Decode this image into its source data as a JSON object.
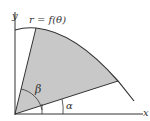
{
  "diagram": {
    "curve_label": "r = f(θ)",
    "axis_x_label": "x",
    "axis_y_label": "y",
    "angle_upper_label": "β",
    "angle_lower_label": "α",
    "colors": {
      "region_fill": "#c8c8c8",
      "stroke": "#333333",
      "background": "#ffffff"
    }
  }
}
